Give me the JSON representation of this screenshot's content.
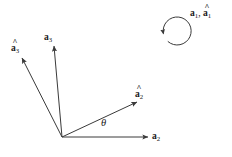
{
  "figure": {
    "type": "vector-rotation-diagram",
    "background_color": "#ffffff",
    "stroke_color": "#3a3a3a",
    "text_color": "#1a1a1a"
  },
  "origin": {
    "x": 62,
    "y": 137
  },
  "labels": {
    "a3": {
      "base": "a",
      "sub": "3",
      "hat": ""
    },
    "a3_hat": {
      "base": "a",
      "sub": "3",
      "hat": "^"
    },
    "a2": {
      "base": "a",
      "sub": "2",
      "hat": ""
    },
    "a2_hat": {
      "base": "a",
      "sub": "2",
      "hat": "^"
    },
    "a1": {
      "base": "a",
      "sub": "1",
      "hat": ""
    },
    "a1_hat": {
      "base": "a",
      "sub": "1",
      "hat": "^"
    },
    "separator": ", ",
    "theta": "θ"
  },
  "vectors": [
    {
      "name": "a3",
      "label": "a3",
      "from": {
        "x": 62,
        "y": 137
      },
      "to": {
        "x": 54,
        "y": 46
      },
      "hatted": false
    },
    {
      "name": "a3-hat",
      "label": "a3_hat",
      "from": {
        "x": 62,
        "y": 137
      },
      "to": {
        "x": 22,
        "y": 58
      },
      "hatted": true
    },
    {
      "name": "a2",
      "label": "a2",
      "from": {
        "x": 62,
        "y": 137
      },
      "to": {
        "x": 148,
        "y": 137
      },
      "hatted": false
    },
    {
      "name": "a2-hat",
      "label": "a2_hat",
      "from": {
        "x": 62,
        "y": 137
      },
      "to": {
        "x": 137,
        "y": 102
      },
      "hatted": true
    }
  ],
  "angle_arc": {
    "symbol": "θ",
    "between": [
      "a2",
      "a2-hat"
    ],
    "position": {
      "x": 101,
      "y": 118
    }
  },
  "rotation_indicator": {
    "direction": "counterclockwise",
    "center": {
      "x": 172,
      "y": 28
    },
    "radius": 14,
    "label_text": "a1, a1-hat",
    "label_position": {
      "x": 190,
      "y": 9
    }
  }
}
